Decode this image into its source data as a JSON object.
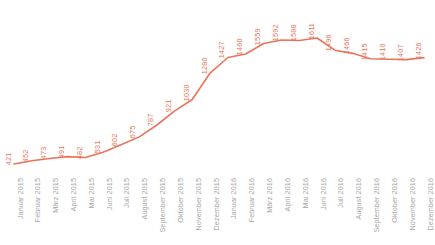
{
  "chart_data": {
    "type": "line",
    "title": "",
    "subtitle": "",
    "xlabel": "",
    "ylabel": "",
    "grid": false,
    "legend": false,
    "legend_position": "none",
    "line_color": "#e8745a",
    "value_label_color": "#e8745a",
    "axis_label_color": "#a6a6a6",
    "ylim": [
      0,
      1700
    ],
    "categories": [
      "Januar 2015",
      "Februar 2015",
      "März 2015",
      "April 2015",
      "Mai 2015",
      "Juni 2015",
      "Juli 2015",
      "August 2015",
      "September 2015",
      "Oktober 2015",
      "November 2015",
      "Dezember 2015",
      "Januar 2016",
      "Februar 2016",
      "März 2016",
      "April 2016",
      "Mai 2016",
      "Juni 2016",
      "Juli 2016",
      "August 2016",
      "September 2016",
      "Oktober 2016",
      "November 2016",
      "Dezember 2016"
    ],
    "values": [
      421,
      452,
      473,
      491,
      482,
      531,
      602,
      675,
      787,
      921,
      1030,
      1280,
      1427,
      1460,
      1559,
      1592,
      1588,
      1611,
      1496,
      1466,
      1415,
      1410,
      1407,
      1426
    ],
    "value_labels": [
      "421",
      "452",
      "473",
      "491",
      "482",
      "531",
      "602",
      "675",
      "787",
      "921",
      "1030",
      "1280",
      "1427",
      "1460",
      "1559",
      "1592",
      "1588",
      "1611",
      "1496",
      "1466",
      "1415",
      "1410",
      "1407",
      "1426"
    ]
  }
}
